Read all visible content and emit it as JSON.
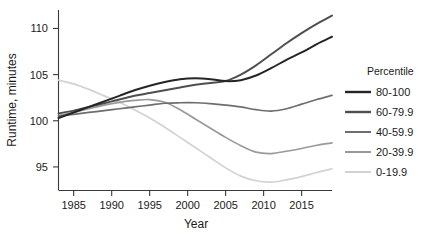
{
  "chart_data": {
    "type": "line",
    "title": "",
    "xlabel": "Year",
    "ylabel": "Runtime, minutes",
    "xlim": [
      1983,
      2019
    ],
    "ylim": [
      92.5,
      112
    ],
    "grid": false,
    "legend_position": "right",
    "legend_title": "Percentile",
    "xticks": [
      1985,
      1990,
      1995,
      2000,
      2005,
      2010,
      2015
    ],
    "yticks": [
      95,
      100,
      105,
      110
    ],
    "x": [
      1983,
      1985,
      1987,
      1989,
      1991,
      1993,
      1995,
      1997,
      1999,
      2001,
      2003,
      2005,
      2007,
      2009,
      2011,
      2013,
      2015,
      2017,
      2019
    ],
    "series": [
      {
        "name": "80-100",
        "color": "#252525",
        "values": [
          100.3,
          100.9,
          101.5,
          102.1,
          102.7,
          103.3,
          103.8,
          104.2,
          104.5,
          104.6,
          104.5,
          104.3,
          104.4,
          104.9,
          105.7,
          106.6,
          107.4,
          108.3,
          109.1
        ]
      },
      {
        "name": "60-79.9",
        "color": "#4f4f4f",
        "values": [
          100.8,
          101.1,
          101.5,
          101.9,
          102.3,
          102.7,
          103.0,
          103.3,
          103.6,
          103.9,
          104.1,
          104.3,
          105.0,
          106.0,
          107.2,
          108.4,
          109.5,
          110.5,
          111.4
        ]
      },
      {
        "name": "40-59.9",
        "color": "#6e6e6e",
        "values": [
          100.5,
          100.7,
          100.9,
          101.1,
          101.3,
          101.5,
          101.7,
          101.9,
          101.95,
          101.95,
          101.85,
          101.7,
          101.5,
          101.2,
          101.05,
          101.3,
          101.8,
          102.3,
          102.75
        ]
      },
      {
        "name": "20-39.9",
        "color": "#9a9a9a",
        "values": [
          100.6,
          100.9,
          101.3,
          101.7,
          102.0,
          102.2,
          102.3,
          102.0,
          101.2,
          100.2,
          99.2,
          98.2,
          97.3,
          96.6,
          96.45,
          96.7,
          97.0,
          97.35,
          97.6
        ]
      },
      {
        "name": "0-19.9",
        "color": "#d2d2d2",
        "values": [
          104.4,
          104.0,
          103.4,
          102.7,
          102.0,
          101.2,
          100.3,
          99.3,
          98.2,
          97.1,
          96.0,
          94.9,
          94.0,
          93.5,
          93.35,
          93.6,
          93.95,
          94.4,
          94.8
        ]
      }
    ]
  },
  "legend": {
    "title": "Percentile",
    "items": [
      {
        "label": "80-100",
        "color": "#252525"
      },
      {
        "label": "60-79.9",
        "color": "#4f4f4f"
      },
      {
        "label": "40-59.9",
        "color": "#6e6e6e"
      },
      {
        "label": "20-39.9",
        "color": "#9a9a9a"
      },
      {
        "label": "0-19.9",
        "color": "#d2d2d2"
      }
    ]
  },
  "axes": {
    "x_title": "Year",
    "y_title": "Runtime, minutes",
    "x_tick_labels": [
      "1985",
      "1990",
      "1995",
      "2000",
      "2005",
      "2010",
      "2015"
    ],
    "y_tick_labels": [
      "95",
      "100",
      "105",
      "110"
    ]
  }
}
